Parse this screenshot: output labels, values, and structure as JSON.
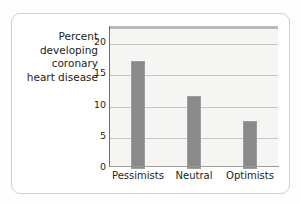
{
  "chart_data": {
    "type": "bar",
    "title": "",
    "categories": [
      "Pessimists",
      "Neutral",
      "Optimists"
    ],
    "values": [
      17.3,
      11.7,
      7.7
    ],
    "xlabel": "",
    "ylabel": "Percent developing coronary heart disease",
    "ylim": [
      0,
      22.4
    ],
    "yticks": [
      0,
      5,
      10,
      15,
      20
    ],
    "ytick_labels": [
      "0",
      "5",
      "10",
      "15",
      "20"
    ],
    "grid": true,
    "legend": false,
    "bar_color": "#8a8a8a",
    "plot_background": "#f5f5f3",
    "gridline_color": "#c6c6c4"
  },
  "axis": {
    "y_label_text": "Percent\ndeveloping\ncoronary\nheart disease"
  }
}
